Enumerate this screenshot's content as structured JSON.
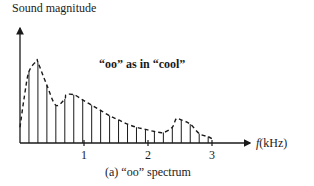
{
  "chart_data": {
    "type": "bar",
    "subtype": "line-spectrum-with-envelope",
    "title": "",
    "ylabel": "Sound magnitude",
    "xlabel_var": "f",
    "xlabel_unit": "(kHz)",
    "annotation": "“oo” as in “cool”",
    "caption": "(a)  “oo” spectrum",
    "xlim": [
      0,
      3.6
    ],
    "ylim": [
      0,
      1.0
    ],
    "x_ticks": [
      1,
      2,
      3
    ],
    "x_tick_labels": [
      "1",
      "2",
      "3"
    ],
    "y_ticks": [],
    "grid": false,
    "legend": null,
    "fundamental_khz": 0.14,
    "harmonics": {
      "x": [
        0.14,
        0.28,
        0.42,
        0.56,
        0.7,
        0.84,
        0.98,
        1.12,
        1.26,
        1.4,
        1.54,
        1.68,
        1.82,
        1.96,
        2.1,
        2.24,
        2.38,
        2.52,
        2.66,
        2.8,
        2.94
      ],
      "values": [
        0.68,
        0.77,
        0.55,
        0.36,
        0.42,
        0.46,
        0.41,
        0.36,
        0.31,
        0.26,
        0.22,
        0.18,
        0.15,
        0.13,
        0.11,
        0.1,
        0.15,
        0.22,
        0.18,
        0.09,
        0.06
      ]
    },
    "envelope": {
      "style": "dashed",
      "peaks_khz": [
        0.26,
        0.72,
        2.44
      ],
      "peak_values": [
        0.78,
        0.46,
        0.23
      ]
    }
  },
  "labels": {
    "ylabel": "Sound magnitude",
    "annotation": "“oo” as in “cool”",
    "xlabel_var": "f",
    "xlabel_unit": "(kHz)",
    "tick1": "1",
    "tick2": "2",
    "tick3": "3",
    "caption": "(a)  “oo” spectrum"
  }
}
